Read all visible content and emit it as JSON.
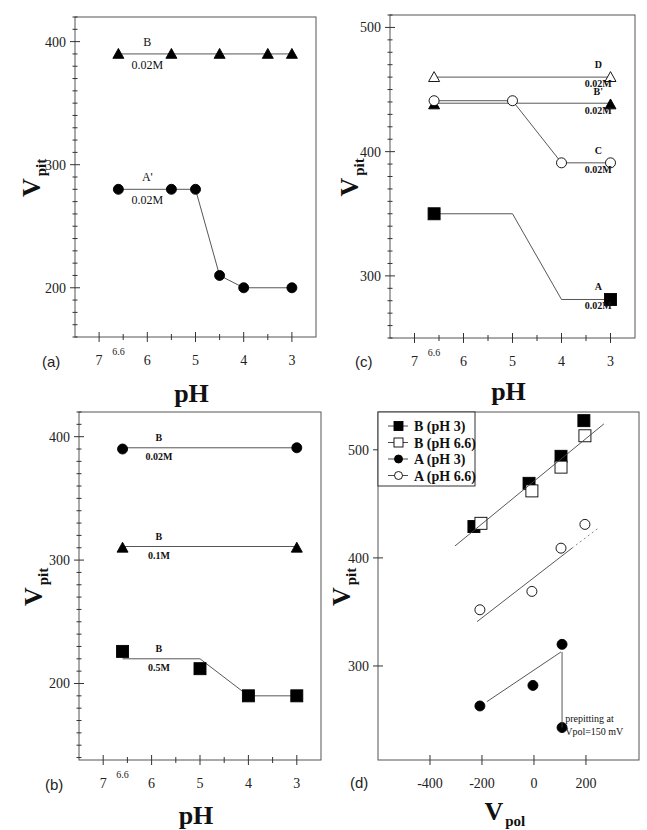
{
  "figure": {
    "panels": [
      {
        "id": "a",
        "label": "(a)"
      },
      {
        "id": "c",
        "label": "(c)"
      },
      {
        "id": "b",
        "label": "(b)"
      },
      {
        "id": "d",
        "label": "(d)"
      }
    ]
  },
  "chart_data": [
    {
      "panel": "(a)",
      "type": "line",
      "title": "",
      "xlabel": "pH",
      "ylabel": "V pit",
      "ylabel_main": "V",
      "ylabel_sub": "pit",
      "xlim": [
        7.5,
        2.5
      ],
      "ylim": [
        160,
        420
      ],
      "x_reversed": true,
      "xticks": [
        7,
        6,
        5,
        4,
        3
      ],
      "xtick_extra": {
        "value": 6.6,
        "label": "6.6"
      },
      "yticks": [
        200,
        300,
        400
      ],
      "grid": false,
      "series": [
        {
          "name": "B",
          "annotation": "B",
          "annotation2": "0.02M",
          "marker": "triangle-filled",
          "x": [
            6.6,
            5.5,
            4.5,
            3.5,
            3
          ],
          "y": [
            390,
            390,
            390,
            390,
            390
          ],
          "line_x": [
            6.6,
            3
          ],
          "line_y": [
            390,
            390
          ]
        },
        {
          "name": "A'",
          "annotation": "A'",
          "annotation2": "0.02M",
          "marker": "circle-filled",
          "x": [
            6.6,
            5.5,
            5,
            4.5,
            4,
            3
          ],
          "y": [
            280,
            280,
            280,
            210,
            200,
            200
          ],
          "line_x": [
            6.6,
            5.5,
            5,
            4.5,
            4,
            3
          ],
          "line_y": [
            280,
            280,
            280,
            210,
            200,
            200
          ]
        }
      ]
    },
    {
      "panel": "(c)",
      "type": "line",
      "title": "",
      "xlabel": "pH",
      "ylabel": "V pit",
      "ylabel_main": "V",
      "ylabel_sub": "pit",
      "xlim": [
        7.5,
        2.5
      ],
      "ylim": [
        250,
        510
      ],
      "x_reversed": true,
      "xticks": [
        7,
        6,
        5,
        4,
        3
      ],
      "xtick_extra": {
        "value": 6.6,
        "label": "6.6"
      },
      "yticks": [
        300,
        400,
        500
      ],
      "grid": false,
      "series": [
        {
          "name": "D",
          "annotation": "D",
          "annotation2": "0.02M",
          "marker": "triangle-open",
          "x": [
            6.6,
            3
          ],
          "y": [
            460,
            460
          ],
          "line_x": [
            6.6,
            3
          ],
          "line_y": [
            460,
            460
          ]
        },
        {
          "name": "B'",
          "annotation": "B'",
          "annotation2": "0.02M",
          "marker": "triangle-filled",
          "x": [
            6.6,
            3
          ],
          "y": [
            438,
            438
          ],
          "line_x": [
            6.6,
            3
          ],
          "line_y": [
            439,
            439
          ]
        },
        {
          "name": "C",
          "annotation": "C",
          "annotation2": "0.02M",
          "marker": "circle-open",
          "x": [
            6.6,
            5,
            4,
            3
          ],
          "y": [
            441,
            441,
            391,
            391
          ],
          "line_x": [
            6.6,
            5,
            4,
            3
          ],
          "line_y": [
            441,
            441,
            391,
            391
          ]
        },
        {
          "name": "A",
          "annotation": "A",
          "annotation2": "0.02M",
          "marker": "square-filled",
          "x": [
            6.6,
            3
          ],
          "y": [
            350,
            281
          ],
          "line_x": [
            6.6,
            5,
            4,
            3
          ],
          "line_y": [
            350,
            350,
            281,
            281
          ]
        }
      ]
    },
    {
      "panel": "(b)",
      "type": "line",
      "title": "",
      "xlabel": "pH",
      "ylabel": "V pit",
      "ylabel_main": "V",
      "ylabel_sub": "pit",
      "xlim": [
        7.5,
        2.5
      ],
      "ylim": [
        138,
        420
      ],
      "x_reversed": true,
      "xticks": [
        7,
        6,
        5,
        4,
        3
      ],
      "xtick_extra": {
        "value": 6.6,
        "label": "6.6"
      },
      "yticks": [
        200,
        300,
        400
      ],
      "grid": false,
      "series": [
        {
          "name": "B 0.02M",
          "annotation": "B",
          "annotation2": "0.02M",
          "marker": "circle-filled",
          "x": [
            6.6,
            3
          ],
          "y": [
            390,
            391
          ],
          "line_x": [
            6.6,
            3
          ],
          "line_y": [
            391,
            391
          ]
        },
        {
          "name": "B 0.1M",
          "annotation": "B",
          "annotation2": "0.1M",
          "marker": "triangle-filled",
          "x": [
            6.6,
            3
          ],
          "y": [
            310,
            310
          ],
          "line_x": [
            6.6,
            3
          ],
          "line_y": [
            311,
            311
          ]
        },
        {
          "name": "B 0.5M",
          "annotation": "B",
          "annotation2": "0.5M",
          "marker": "square-filled",
          "x": [
            6.6,
            5,
            4,
            3
          ],
          "y": [
            226,
            212,
            190,
            190
          ],
          "line_x": [
            6.6,
            5,
            4,
            3
          ],
          "line_y": [
            220,
            220,
            190,
            190
          ]
        }
      ]
    },
    {
      "panel": "(d)",
      "type": "scatter",
      "title": "",
      "xlabel": "V pol",
      "xlabel_main": "V",
      "xlabel_sub": "pol",
      "ylabel": "V pit",
      "ylabel_main": "V",
      "ylabel_sub": "pit",
      "xlim": [
        -600,
        404
      ],
      "ylim": [
        213,
        535
      ],
      "xticks": [
        -400,
        -200,
        0,
        200
      ],
      "yticks": [
        300,
        400,
        500
      ],
      "grid": false,
      "legend_position": "upper-left",
      "legend": [
        "B (pH 3)",
        "B (pH 6.6)",
        "A (pH 3)",
        "A (pH 6.6)"
      ],
      "series": [
        {
          "name": "B (pH 3)",
          "marker": "square-filled",
          "x": [
            -231,
            -19,
            104,
            192
          ],
          "y": [
            429,
            469,
            494,
            527
          ]
        },
        {
          "name": "B (pH 6.6)",
          "marker": "square-open",
          "x": [
            -204,
            -8,
            104,
            196
          ],
          "y": [
            432,
            462,
            484,
            513
          ]
        },
        {
          "name": "A (pH 3)",
          "marker": "circle-filled",
          "x": [
            -208,
            -4,
            108,
            108
          ],
          "y": [
            263,
            282,
            320,
            243
          ]
        },
        {
          "name": "A (pH 6.6)",
          "marker": "circle-open",
          "x": [
            -208,
            -8,
            104,
            196
          ],
          "y": [
            352,
            369,
            409,
            431
          ]
        }
      ],
      "fit_lines": [
        {
          "name": "B fit",
          "x": [
            -304,
            269
          ],
          "y": [
            411,
            524
          ],
          "style": "solid"
        },
        {
          "name": "A (pH 6.6) fit",
          "x": [
            -219,
            146
          ],
          "y": [
            341,
            409
          ],
          "style": "solid"
        },
        {
          "name": "A (pH 6.6) fit ext",
          "x": [
            146,
            250
          ],
          "y": [
            409,
            428
          ],
          "style": "dotted"
        },
        {
          "name": "A (pH 3) fit",
          "x": [
            -181,
            104
          ],
          "y": [
            267,
            313
          ],
          "style": "solid"
        },
        {
          "name": "A (pH 3) prepitting drop",
          "x": [
            108,
            108
          ],
          "y": [
            313,
            243
          ],
          "style": "solid"
        }
      ],
      "annotations": [
        {
          "text": "prepitting at",
          "x": 120,
          "y": 248
        },
        {
          "text": "Vpol=150 mV",
          "x": 120,
          "y": 236
        }
      ]
    }
  ]
}
